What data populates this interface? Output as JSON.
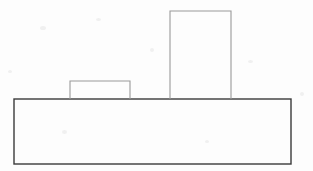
{
  "document": {
    "title": "Stepped block outline drawing",
    "view": "front elevation",
    "background_color": "#fdfdfd",
    "canvas_width": 313,
    "canvas_height": 171
  },
  "drawing": {
    "line_color_base": "#3a3a3a",
    "line_color_feature": "#9a9a9a",
    "stroke_width_base": 1.4,
    "stroke_width_feature": 1.1,
    "fill": "none",
    "shapes": [
      {
        "name": "base-plate",
        "label": "Base plate",
        "type": "rectangle",
        "x": 14,
        "y": 99,
        "width": 277,
        "height": 65,
        "stroke": "#3a3a3a",
        "stroke_width": 1.4,
        "fill": "none",
        "closed": true
      },
      {
        "name": "short-boss",
        "label": "Short boss",
        "type": "rectangle-open-bottom",
        "x": 70,
        "y": 81,
        "width": 60,
        "height": 18,
        "stroke": "#9a9a9a",
        "stroke_width": 1.1,
        "fill": "none",
        "closed": false
      },
      {
        "name": "tall-boss",
        "label": "Tall boss",
        "type": "rectangle-open-bottom",
        "x": 170,
        "y": 11,
        "width": 61,
        "height": 88,
        "stroke": "#9a9a9a",
        "stroke_width": 1.1,
        "fill": "none",
        "closed": false
      }
    ]
  },
  "chart_data": {
    "type": "line",
    "xlabel": "",
    "ylabel": "",
    "xlim": [
      0,
      313
    ],
    "ylim": [
      0,
      171
    ],
    "grid": false,
    "legend": "none",
    "series": [
      {
        "name": "base-plate",
        "x": [
          14,
          291,
          291,
          14,
          14
        ],
        "y": [
          99,
          99,
          164,
          164,
          99
        ]
      },
      {
        "name": "short-boss",
        "x": [
          70,
          70,
          130,
          130
        ],
        "y": [
          99,
          81,
          81,
          99
        ]
      },
      {
        "name": "tall-boss",
        "x": [
          170,
          170,
          231,
          231
        ],
        "y": [
          99,
          11,
          11,
          99
        ]
      }
    ]
  }
}
